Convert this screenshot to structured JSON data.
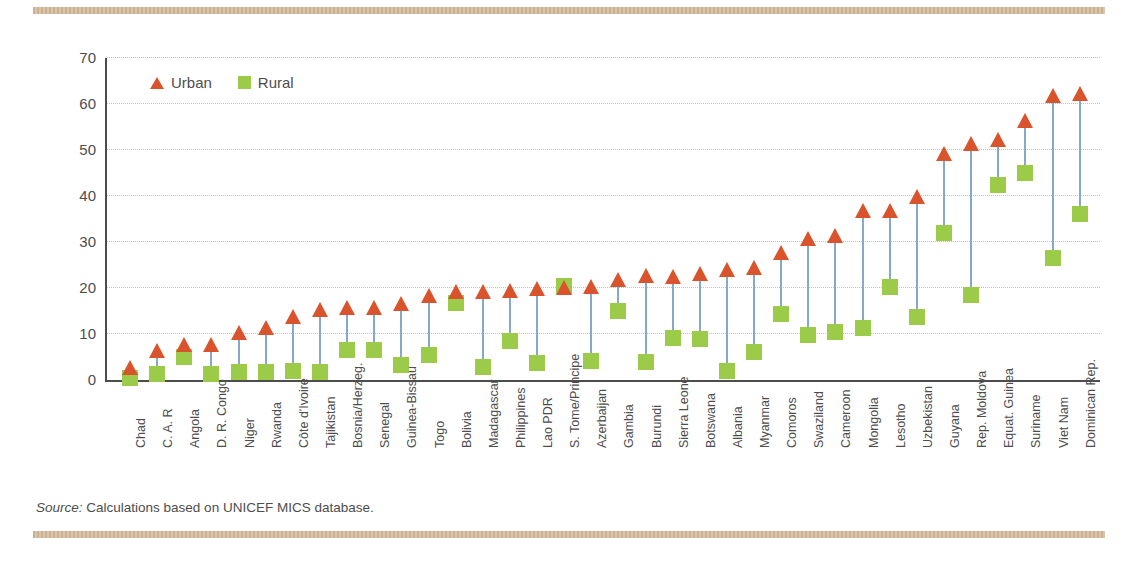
{
  "figure": {
    "source_prefix": "Source:",
    "source_text": "Calculations based on UNICEF MICS database."
  },
  "colors": {
    "urban": "#d9532c",
    "rural": "#9ccb4a",
    "stem": "#86a9c9",
    "grid": "#a8c8e8",
    "axis": "#4d4d4d",
    "rule": "#cdb294"
  },
  "chart_data": {
    "type": "scatter",
    "title": "",
    "subtitle": "",
    "xlabel": "",
    "ylabel": "Net attendance rate (%)",
    "ylim": [
      0,
      70
    ],
    "yticks": [
      0,
      10,
      20,
      30,
      40,
      50,
      60,
      70
    ],
    "ytick_labels": [
      "0",
      "10",
      "20",
      "30",
      "40",
      "50",
      "60",
      "70"
    ],
    "grid": "horizontal dotted",
    "legend_position": "top-left inside axes",
    "legend": [
      {
        "name": "Urban",
        "marker": "triangle",
        "color": "#d9532c"
      },
      {
        "name": "Rural",
        "marker": "square",
        "color": "#9ccb4a"
      }
    ],
    "annotation": "Vertical connector lines join the Rural and Urban value for each country.",
    "categories": [
      "Chad",
      "C. A. R",
      "Angola",
      "D. R. Congo",
      "Niger",
      "Rwanda",
      "Côte d'Ivoire",
      "Tajikistan",
      "Bosnia/Herzeg.",
      "Senegal",
      "Guinea-Bissau",
      "Togo",
      "Bolivia",
      "Madagascar",
      "Philippines",
      "Lao PDR",
      "S. Tome/Principe",
      "Azerbaijan",
      "Gambia",
      "Burundi",
      "Sierra Leone",
      "Botswana",
      "Albania",
      "Myanmar",
      "Comoros",
      "Swaziland",
      "Cameroon",
      "Mongolia",
      "Lesotho",
      "Uzbekistan",
      "Guyana",
      "Rep. Moldova",
      "Equat. Guinea",
      "Suriname",
      "Viet Nam",
      "Dominican Rep."
    ],
    "series": [
      {
        "name": "Urban",
        "marker": "triangle",
        "color": "#d9532c",
        "values": [
          2.5,
          6.0,
          7.5,
          7.5,
          10.0,
          11.0,
          13.5,
          15.0,
          15.5,
          15.5,
          16.2,
          18.0,
          19.0,
          19.0,
          19.2,
          19.5,
          19.8,
          20.0,
          21.5,
          22.3,
          22.2,
          22.8,
          23.8,
          24.2,
          27.5,
          30.5,
          31.0,
          36.5,
          36.5,
          39.5,
          49.0,
          51.0,
          52.0,
          56.0,
          61.5,
          62.0
        ]
      },
      {
        "name": "Rural",
        "marker": "square",
        "color": "#9ccb4a",
        "values": [
          0.5,
          1.2,
          5.0,
          1.2,
          1.8,
          1.8,
          2.0,
          1.8,
          6.5,
          6.5,
          3.2,
          5.5,
          16.8,
          2.8,
          8.5,
          3.8,
          20.5,
          4.2,
          15.0,
          4.0,
          9.2,
          9.0,
          2.0,
          6.0,
          14.3,
          9.8,
          10.5,
          11.3,
          20.3,
          13.8,
          32.0,
          18.5,
          42.5,
          45.0,
          26.5,
          36.0
        ]
      }
    ]
  }
}
